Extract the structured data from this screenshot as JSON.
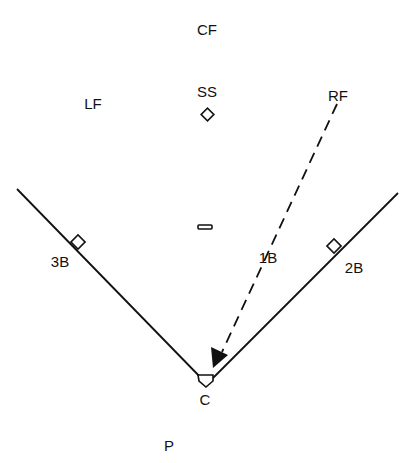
{
  "diagram": {
    "type": "baseball-field-positions",
    "line_color": "#111111",
    "background": "#ffffff",
    "positions": {
      "cf": "CF",
      "ss": "SS",
      "lf": "LF",
      "rf": "RF",
      "third_base": "3B",
      "first_base": "1B",
      "second_base": "2B",
      "catcher": "C",
      "pitcher": "P"
    },
    "arrow": {
      "from": "RF",
      "to": "C",
      "style": "dashed"
    }
  }
}
